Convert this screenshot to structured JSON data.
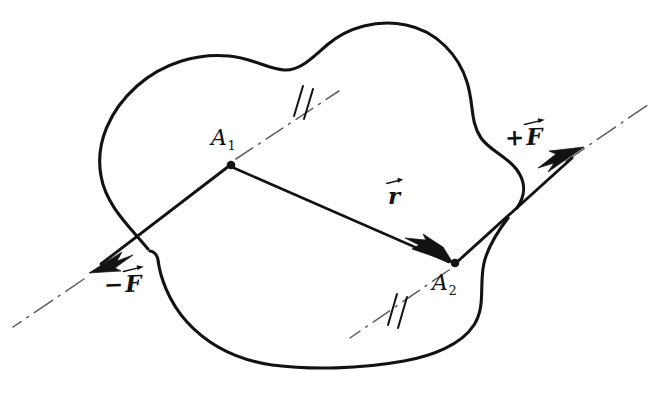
{
  "figure": {
    "background_color": "#ffffff",
    "ink_color": "#121212",
    "axis_color": "#5d5d63"
  },
  "labels": {
    "point_1": {
      "symbol": "A",
      "subscript": "1"
    },
    "point_2": {
      "symbol": "A",
      "subscript": "2"
    },
    "force_positive": {
      "sign": "+",
      "symbol": "F",
      "vector": true
    },
    "force_negative": {
      "sign": "−",
      "symbol": "F",
      "vector": true
    },
    "separation_vector": {
      "sign": "",
      "symbol": "r",
      "vector": true
    }
  },
  "markers": {
    "parallel_tick_count": 2,
    "parallel_tick_note": "double hatch marks indicating parallel lines of action"
  },
  "geometry": {
    "point_A1": {
      "x": 231,
      "y": 165
    },
    "point_A2": {
      "x": 455,
      "y": 263
    },
    "force_line_angle_deg": -36.5,
    "arrow_plus_F_tip": {
      "x": 582,
      "y": 148
    },
    "arrow_minus_F_tip": {
      "x": 90,
      "y": 272
    },
    "r_arrow_tip": {
      "x": 452,
      "y": 261
    }
  }
}
